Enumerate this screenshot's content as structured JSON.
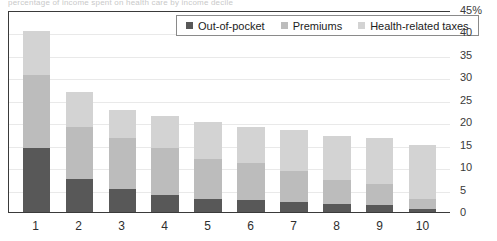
{
  "top_caption": "percentage of income spent on health care by income decile",
  "legend": {
    "position": "top-center-inside",
    "items": [
      {
        "label": "Out-of-pocket",
        "color": "#585858",
        "key": "out_of_pocket"
      },
      {
        "label": "Premiums",
        "color": "#bcbcbc",
        "key": "premiums"
      },
      {
        "label": "Health-related taxes",
        "color": "#d3d3d3",
        "key": "health_related_taxes"
      }
    ]
  },
  "y_axis": {
    "ticks": [
      "45%",
      "40",
      "35",
      "30",
      "25",
      "20",
      "15",
      "10",
      "5",
      "0"
    ],
    "values": [
      45,
      40,
      35,
      30,
      25,
      20,
      15,
      10,
      5,
      0
    ],
    "min": 0,
    "max": 45,
    "step": 5,
    "side": "right"
  },
  "x_axis": {
    "labels": [
      "1",
      "2",
      "3",
      "4",
      "5",
      "6",
      "7",
      "8",
      "9",
      "10"
    ]
  },
  "chart_data": {
    "type": "bar",
    "subtype": "stacked-vertical",
    "title": "",
    "xlabel": "",
    "ylabel": "",
    "ylim": [
      0,
      45
    ],
    "yunit": "%",
    "grid": true,
    "legend_position": "top-center-inside",
    "categories": [
      "1",
      "2",
      "3",
      "4",
      "5",
      "6",
      "7",
      "8",
      "9",
      "10"
    ],
    "series": [
      {
        "name": "Out-of-pocket",
        "color": "#585858",
        "values": [
          14.3,
          7.3,
          5.2,
          3.9,
          3.0,
          2.7,
          2.3,
          1.8,
          1.5,
          0.6
        ]
      },
      {
        "name": "Premiums",
        "color": "#bcbcbc",
        "values": [
          16.2,
          11.6,
          11.3,
          10.4,
          8.8,
          8.3,
          6.9,
          5.4,
          4.7,
          2.2
        ]
      },
      {
        "name": "Health-related taxes",
        "color": "#d3d3d3",
        "values": [
          9.8,
          7.8,
          6.3,
          7.0,
          8.2,
          8.0,
          9.1,
          9.8,
          10.3,
          12.2
        ]
      }
    ],
    "totals": [
      40.3,
      26.7,
      22.8,
      21.3,
      20.0,
      19.0,
      18.3,
      17.0,
      16.5,
      15.0
    ]
  },
  "colors": {
    "axis": "#3a3a3a",
    "grid": "#e9e9e9",
    "background": "#ffffff",
    "text": "#1c1c1c"
  }
}
